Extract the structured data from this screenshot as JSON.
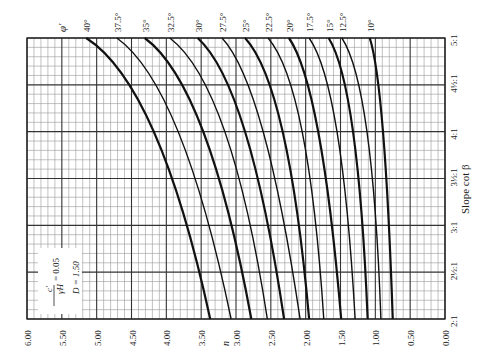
{
  "chart_data": {
    "type": "line",
    "title": "",
    "orientation": "rotated 90° (n axis horizontal, reversed; slope axis vertical)",
    "xlabel": "n",
    "ylabel": "Slope cot β",
    "n_ticks": [
      "6.00",
      "5.50",
      "5.00",
      "4.50",
      "4.00",
      "3.50",
      "3.00",
      "2.50",
      "2.00",
      "1.50",
      "1.00",
      "0.50",
      "0.00"
    ],
    "slope_ticks": [
      "2:1",
      "2½:1",
      "3:1",
      "3½:1",
      "4:1",
      "4½:1",
      "5:1"
    ],
    "slope_values": [
      2.0,
      2.5,
      3.0,
      3.5,
      4.0,
      4.5,
      5.0
    ],
    "xlim": [
      6.0,
      0.0
    ],
    "ylim": [
      2.0,
      5.0
    ],
    "grid": true,
    "legend_title": "φ′",
    "annotation": {
      "ratio_numerator": "c′",
      "ratio_denominator": "γH",
      "ratio_value": "= 0.05",
      "depth_factor": "D = 1.50"
    },
    "sample_slopes": [
      2.0,
      4.0,
      5.0
    ],
    "series": [
      {
        "name": "40°",
        "n": [
          3.37,
          4.18,
          5.15
        ]
      },
      {
        "name": "37.5°",
        "n": [
          3.07,
          3.83,
          4.71
        ]
      },
      {
        "name": "35°",
        "n": [
          2.78,
          3.47,
          4.31
        ]
      },
      {
        "name": "32.5°",
        "n": [
          2.55,
          3.16,
          3.95
        ]
      },
      {
        "name": "30°",
        "n": [
          2.31,
          2.87,
          3.55
        ]
      },
      {
        "name": "27.5°",
        "n": [
          2.08,
          2.61,
          3.2
        ]
      },
      {
        "name": "25°",
        "n": [
          1.95,
          2.33,
          2.87
        ]
      },
      {
        "name": "22.5°",
        "n": [
          1.74,
          2.05,
          2.54
        ]
      },
      {
        "name": "20°",
        "n": [
          1.49,
          1.82,
          2.24
        ]
      },
      {
        "name": "17.5°",
        "n": [
          1.29,
          1.55,
          1.95
        ]
      },
      {
        "name": "15°",
        "n": [
          1.11,
          1.32,
          1.67
        ]
      },
      {
        "name": "12.5°",
        "n": [
          0.92,
          1.12,
          1.48
        ]
      },
      {
        "name": "10°",
        "n": [
          0.75,
          0.89,
          1.08
        ]
      }
    ]
  },
  "labels": {
    "phi": "φ′",
    "n_axis": "n",
    "slope_axis": "Slope cot β",
    "ratio_num": "c′",
    "ratio_den": "γH",
    "ratio_val": "= 0.05",
    "depth": "D = 1.50"
  }
}
